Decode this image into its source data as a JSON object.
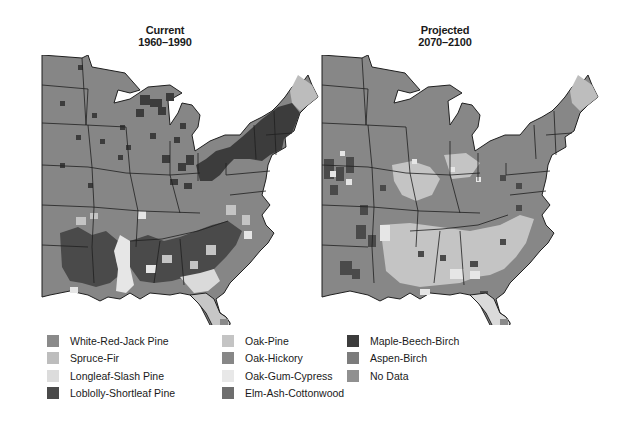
{
  "maps": [
    {
      "id": "current",
      "title": "Current",
      "period": "1960–1990"
    },
    {
      "id": "projected",
      "title": "Projected",
      "period": "2070–2100"
    }
  ],
  "legend": {
    "columns": [
      [
        {
          "label": "White-Red-Jack Pine",
          "color": "#8a8a8a"
        },
        {
          "label": "Spruce-Fir",
          "color": "#bdbdbd"
        },
        {
          "label": "Longleaf-Slash Pine",
          "color": "#dcdcdc"
        },
        {
          "label": "Loblolly-Shortleaf Pine",
          "color": "#4a4a4a"
        }
      ],
      [
        {
          "label": "Oak-Pine",
          "color": "#c4c4c4"
        },
        {
          "label": "Oak-Hickory",
          "color": "#878787"
        },
        {
          "label": "Oak-Gum-Cypress",
          "color": "#e8e8e8"
        },
        {
          "label": "Elm-Ash-Cottonwood",
          "color": "#6e6e6e"
        }
      ],
      [
        {
          "label": "Maple-Beech-Birch",
          "color": "#3c3c3c"
        },
        {
          "label": "Aspen-Birch",
          "color": "#7c7c7c"
        },
        {
          "label": "No Data",
          "color": "#909090"
        }
      ]
    ]
  },
  "colors": {
    "state_border": "#1f1f1f",
    "base_region": "#858585",
    "background": "#ffffff"
  }
}
